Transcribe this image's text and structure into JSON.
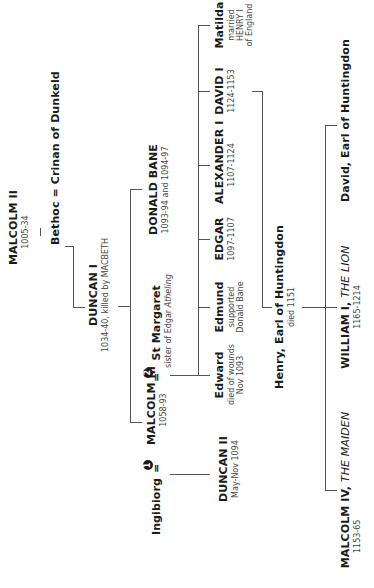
{
  "people": {
    "malcolm_ii": {
      "name": "MALCOLM II",
      "dates": "1005-34"
    },
    "bethoc_crinan": {
      "name": "Bethoc = Crinan of Dunkeld"
    },
    "duncan_i": {
      "name": "DUNCAN I",
      "dates": "1034-40, killed by MACBETH"
    },
    "donald_bane": {
      "name": "DONALD BANE",
      "dates": "1093-94 and 1094-97"
    },
    "ingibiorg": {
      "name": "Ingibiorg",
      "marriage": "=",
      "marker": "1"
    },
    "malcolm_iii": {
      "name": "MALCOLM III",
      "dates": "1058-93"
    },
    "st_margaret": {
      "name": "St Margaret",
      "marriage": "=",
      "marker": "2",
      "note": "sister of Edgar",
      "note_italic": "Atheling"
    },
    "duncan_ii": {
      "name": "DUNCAN II",
      "dates": "May-Nov 1094"
    },
    "edward": {
      "name": "Edward",
      "note": [
        "died of wounds",
        "Nov 1093"
      ]
    },
    "edmund": {
      "name": "Edmund",
      "note": [
        "supported",
        "Donald Bane"
      ]
    },
    "edgar": {
      "name": "EDGAR",
      "dates": "1097-1107"
    },
    "alexander_i": {
      "name": "ALEXANDER I",
      "dates": "1107-1124"
    },
    "david_i": {
      "name": "DAVID I",
      "dates": "1124-1153"
    },
    "matilda": {
      "name": "Matilda",
      "note": [
        "married",
        "HENRY I",
        "of England"
      ]
    },
    "henry": {
      "name": "Henry, Earl of Huntingdon",
      "dates": "died 1151"
    },
    "malcolm_iv": {
      "name": "MALCOLM IV,",
      "epithet": "THE MAIDEN",
      "dates": "1153-65"
    },
    "william_i": {
      "name": "WILLIAM I,",
      "epithet": "THE LION",
      "dates": "1165-1214"
    },
    "david_huntingdon": {
      "name": "David, Earl of Huntingdon"
    }
  }
}
